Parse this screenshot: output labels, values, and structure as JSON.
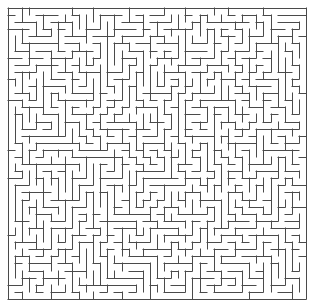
{
  "document": {
    "title": "Maze",
    "type": "maze-puzzle",
    "width": 315,
    "height": 304,
    "background_color": "#ffffff"
  },
  "maze": {
    "label": "Rectangular perfect maze",
    "columns": 42,
    "rows": 41,
    "cell_size": 7.095,
    "origin_x": 8,
    "origin_y": 8,
    "grid_width": 298,
    "grid_height": 291,
    "wall_color": "#4a4a4a",
    "wall_thickness": 1,
    "border_closed": true,
    "border_sides": [
      "top",
      "right",
      "bottom",
      "left"
    ],
    "entrance": null,
    "exit": null,
    "algorithm": "recursive-backtracker",
    "seed": 20240917,
    "loops": 0,
    "description": "Dense single-solution grid maze drawn in thin dark-gray lines on a white field, fully enclosed by a solid rectangular outer wall."
  }
}
